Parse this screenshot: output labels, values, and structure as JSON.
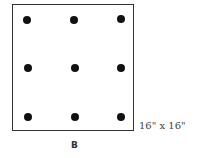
{
  "diagram": {
    "label": "B",
    "dimension_label": "16\" x 16\"",
    "grid": {
      "rows": 3,
      "cols": 3
    },
    "dot_color": "#111111",
    "border_color": "#333333"
  }
}
